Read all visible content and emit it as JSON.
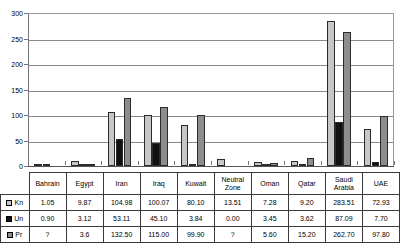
{
  "chart_data": {
    "type": "bar",
    "title": "",
    "xlabel": "",
    "ylabel": "",
    "ylim": [
      0,
      300
    ],
    "ytick_step": 50,
    "yticks": [
      "0",
      "50",
      "100",
      "150",
      "200",
      "250",
      "300"
    ],
    "grid": true,
    "legend_position": "table-left",
    "categories": [
      "Bahrain",
      "Egypt",
      "Iran",
      "Iraq",
      "Kuwait",
      "Neutral Zone",
      "Oman",
      "Qatar",
      "Saudi Arabia",
      "UAE"
    ],
    "series": [
      {
        "name": "Kn",
        "color": "#c7c7c7",
        "values": [
          1.05,
          9.87,
          104.98,
          100.07,
          80.1,
          13.51,
          7.28,
          9.2,
          283.51,
          72.93
        ],
        "labels": [
          "1.05",
          "9.87",
          "104.98",
          "100.07",
          "80.10",
          "13.51",
          "7.28",
          "9.20",
          "283.51",
          "72.93"
        ]
      },
      {
        "name": "Un",
        "color": "#111111",
        "values": [
          0.9,
          3.12,
          53.11,
          45.1,
          3.84,
          0.0,
          3.45,
          3.62,
          87.09,
          7.7
        ],
        "labels": [
          "0.90",
          "3.12",
          "53.11",
          "45.10",
          "3.84",
          "0.00",
          "3.45",
          "3.62",
          "87.09",
          "7.70"
        ]
      },
      {
        "name": "Pr",
        "color": "#8d8d8d",
        "values": [
          null,
          3.6,
          132.5,
          115.0,
          99.9,
          null,
          5.6,
          15.2,
          262.7,
          97.8
        ],
        "labels": [
          "?",
          "3.6",
          "132.50",
          "115.00",
          "99.90",
          "?",
          "5.60",
          "15.20",
          "262.70",
          "97.80"
        ]
      }
    ]
  },
  "legend": {
    "items": [
      {
        "label": "Kn",
        "swatch": "light-gray-swatch-icon"
      },
      {
        "label": "Un",
        "swatch": "black-swatch-icon"
      },
      {
        "label": "Pr",
        "swatch": "medium-gray-swatch-icon"
      }
    ]
  }
}
